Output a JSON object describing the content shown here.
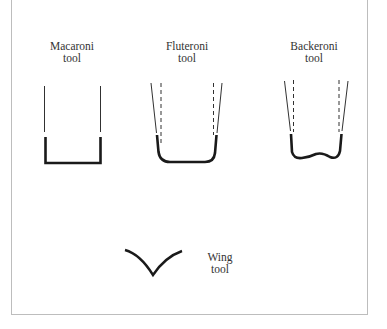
{
  "diagram": {
    "tools": [
      {
        "name": "Macaroni",
        "line2": "tool"
      },
      {
        "name": "Fluteroni",
        "line2": "tool"
      },
      {
        "name": "Backeroni",
        "line2": "tool"
      },
      {
        "name": "Wing",
        "line2": "tool"
      }
    ],
    "colors": {
      "stroke": "#1a1a1a",
      "border": "#bdbdbd",
      "text": "#333333"
    }
  }
}
